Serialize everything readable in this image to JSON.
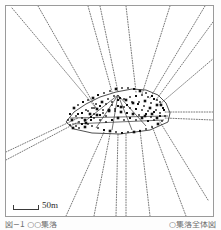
{
  "figure": {
    "kind": "settlement-plan-map",
    "frame": {
      "x": 5,
      "y": 5,
      "width": 209,
      "height": 212,
      "stroke": "#9a9a9a"
    },
    "colors": {
      "ink": "#1a1a1a",
      "road_dotted": "#555555",
      "frame": "#9a9a9a",
      "paper": "#ffffff",
      "caption": "#6f6f6f"
    }
  },
  "scale_bar": {
    "label": "50m",
    "bar_length_px": 26,
    "x": 13,
    "y": 201
  },
  "caption": {
    "left_text": "図−1  ○○集落",
    "right_text": "○集落全体図",
    "note": "clipped at image bottom edge, illegible"
  },
  "chart_data": {
    "type": "scatter",
    "title": "",
    "xlabel": "",
    "ylabel": "",
    "grid": false,
    "legend": "none",
    "xlim": [
      0,
      221
    ],
    "ylim": [
      0,
      230
    ],
    "roads_dotted": [
      {
        "from": [
          12,
          8
        ],
        "to": [
          96,
          108
        ]
      },
      {
        "from": [
          38,
          6
        ],
        "to": [
          96,
          108
        ]
      },
      {
        "from": [
          88,
          6
        ],
        "to": [
          112,
          92
        ]
      },
      {
        "from": [
          100,
          6
        ],
        "to": [
          118,
          92
        ]
      },
      {
        "from": [
          126,
          6
        ],
        "to": [
          136,
          92
        ]
      },
      {
        "from": [
          170,
          6
        ],
        "to": [
          142,
          94
        ]
      },
      {
        "from": [
          205,
          6
        ],
        "to": [
          150,
          98
        ]
      },
      {
        "from": [
          213,
          22
        ],
        "to": [
          156,
          100
        ]
      },
      {
        "from": [
          214,
          58
        ],
        "to": [
          160,
          104
        ]
      },
      {
        "from": [
          213,
          112
        ],
        "to": [
          164,
          112
        ]
      },
      {
        "from": [
          213,
          120
        ],
        "to": [
          164,
          118
        ]
      },
      {
        "from": [
          6,
          152
        ],
        "to": [
          78,
          118
        ]
      },
      {
        "from": [
          6,
          160
        ],
        "to": [
          78,
          122
        ]
      },
      {
        "from": [
          66,
          216
        ],
        "to": [
          104,
          132
        ]
      },
      {
        "from": [
          94,
          216
        ],
        "to": [
          110,
          134
        ]
      },
      {
        "from": [
          116,
          216
        ],
        "to": [
          118,
          134
        ]
      },
      {
        "from": [
          126,
          216
        ],
        "to": [
          126,
          134
        ]
      },
      {
        "from": [
          150,
          216
        ],
        "to": [
          140,
          130
        ]
      },
      {
        "from": [
          186,
          216
        ],
        "to": [
          152,
          126
        ]
      },
      {
        "from": [
          208,
          200
        ],
        "to": [
          160,
          122
        ]
      }
    ],
    "core_outline": [
      [
        66,
        122
      ],
      [
        74,
        112
      ],
      [
        86,
        104
      ],
      [
        100,
        97
      ],
      [
        116,
        92
      ],
      [
        132,
        89
      ],
      [
        146,
        90
      ],
      [
        158,
        95
      ],
      [
        166,
        103
      ],
      [
        170,
        113
      ],
      [
        168,
        122
      ],
      [
        150,
        130
      ],
      [
        120,
        134
      ],
      [
        92,
        133
      ],
      [
        74,
        129
      ]
    ],
    "interior_paths": [
      {
        "from": [
          118,
          95
        ],
        "to": [
          112,
          130
        ]
      },
      {
        "from": [
          118,
          95
        ],
        "to": [
          96,
          128
        ]
      },
      {
        "from": [
          118,
          95
        ],
        "to": [
          132,
          130
        ]
      },
      {
        "from": [
          118,
          95
        ],
        "to": [
          146,
          126
        ]
      },
      {
        "from": [
          118,
          95
        ],
        "to": [
          84,
          122
        ]
      },
      {
        "from": [
          70,
          118
        ],
        "to": [
          168,
          116
        ]
      },
      {
        "from": [
          72,
          124
        ],
        "to": [
          164,
          120
        ]
      }
    ],
    "building_points": [
      [
        72,
        120
      ],
      [
        76,
        116
      ],
      [
        79,
        122
      ],
      [
        82,
        113
      ],
      [
        85,
        120
      ],
      [
        88,
        111
      ],
      [
        91,
        117
      ],
      [
        94,
        108
      ],
      [
        97,
        115
      ],
      [
        100,
        106
      ],
      [
        103,
        113
      ],
      [
        106,
        104
      ],
      [
        109,
        111
      ],
      [
        112,
        102
      ],
      [
        115,
        109
      ],
      [
        118,
        100
      ],
      [
        121,
        107
      ],
      [
        124,
        99
      ],
      [
        127,
        105
      ],
      [
        130,
        97
      ],
      [
        133,
        103
      ],
      [
        136,
        96
      ],
      [
        139,
        102
      ],
      [
        142,
        95
      ],
      [
        145,
        101
      ],
      [
        148,
        97
      ],
      [
        151,
        103
      ],
      [
        154,
        99
      ],
      [
        157,
        105
      ],
      [
        160,
        102
      ],
      [
        163,
        108
      ],
      [
        160,
        113
      ],
      [
        157,
        118
      ],
      [
        154,
        112
      ],
      [
        151,
        117
      ],
      [
        148,
        111
      ],
      [
        145,
        116
      ],
      [
        142,
        110
      ],
      [
        139,
        115
      ],
      [
        136,
        109
      ],
      [
        133,
        114
      ],
      [
        130,
        108
      ],
      [
        127,
        113
      ],
      [
        124,
        107
      ],
      [
        121,
        112
      ],
      [
        118,
        106
      ],
      [
        115,
        111
      ],
      [
        112,
        105
      ],
      [
        109,
        110
      ],
      [
        106,
        116
      ],
      [
        103,
        110
      ],
      [
        100,
        115
      ],
      [
        97,
        109
      ],
      [
        94,
        114
      ],
      [
        91,
        120
      ],
      [
        88,
        124
      ],
      [
        85,
        127
      ],
      [
        82,
        124
      ],
      [
        79,
        128
      ],
      [
        76,
        126
      ],
      [
        73,
        128
      ],
      [
        70,
        125
      ],
      [
        68,
        120
      ],
      [
        70,
        114
      ],
      [
        74,
        108
      ],
      [
        78,
        105
      ],
      [
        83,
        102
      ],
      [
        88,
        100
      ],
      [
        93,
        98
      ],
      [
        98,
        95
      ],
      [
        104,
        93
      ],
      [
        110,
        91
      ],
      [
        116,
        89
      ],
      [
        122,
        88
      ],
      [
        128,
        88
      ],
      [
        134,
        89
      ],
      [
        140,
        91
      ],
      [
        146,
        93
      ],
      [
        152,
        96
      ],
      [
        157,
        100
      ],
      [
        161,
        105
      ],
      [
        164,
        110
      ],
      [
        165,
        116
      ],
      [
        162,
        121
      ],
      [
        158,
        124
      ],
      [
        152,
        127
      ],
      [
        146,
        129
      ],
      [
        140,
        131
      ],
      [
        134,
        132
      ],
      [
        128,
        132
      ],
      [
        122,
        133
      ],
      [
        116,
        132
      ],
      [
        110,
        131
      ],
      [
        104,
        130
      ],
      [
        98,
        128
      ],
      [
        92,
        126
      ],
      [
        86,
        123
      ],
      [
        100,
        120
      ],
      [
        106,
        122
      ],
      [
        112,
        120
      ],
      [
        118,
        118
      ],
      [
        124,
        120
      ],
      [
        130,
        118
      ],
      [
        136,
        120
      ],
      [
        142,
        118
      ],
      [
        148,
        121
      ],
      [
        154,
        120
      ],
      [
        94,
        118
      ],
      [
        90,
        114
      ],
      [
        86,
        110
      ],
      [
        82,
        118
      ],
      [
        78,
        114
      ],
      [
        150,
        108
      ],
      [
        144,
        106
      ],
      [
        138,
        104
      ],
      [
        132,
        102
      ],
      [
        126,
        100
      ],
      [
        120,
        98
      ],
      [
        114,
        96
      ],
      [
        108,
        99
      ],
      [
        102,
        102
      ],
      [
        96,
        104
      ],
      [
        92,
        108
      ],
      [
        146,
        114
      ],
      [
        152,
        114
      ],
      [
        156,
        110
      ],
      [
        160,
        116
      ]
    ],
    "point_count": 130
  }
}
